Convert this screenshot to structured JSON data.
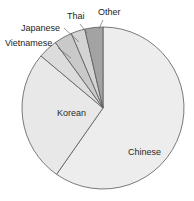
{
  "chart_data": {
    "type": "pie",
    "title": "",
    "subtitle": "",
    "xlabel": "",
    "ylabel": "",
    "legend_position": "none",
    "grid": false,
    "start_angle_deg": 90,
    "direction": "clockwise",
    "categories": [
      "Chinese",
      "Korean",
      "Vietnamese",
      "Japanese",
      "Thai",
      "Other"
    ],
    "values": [
      59.7,
      26.4,
      3.9,
      3.6,
      2.8,
      3.6
    ],
    "units": "percent",
    "slices": [
      {
        "label": "Chinese",
        "value": 59.7,
        "angle_deg": 215,
        "color": "#ededed",
        "label_placement": "inside",
        "label_x": 128,
        "label_y": 155
      },
      {
        "label": "Korean",
        "value": 26.4,
        "angle_deg": 95,
        "color": "#e8e8e8",
        "label_placement": "inside",
        "label_x": 57,
        "label_y": 116
      },
      {
        "label": "Vietnamese",
        "value": 3.9,
        "angle_deg": 14,
        "color": "#dcdcdc",
        "label_placement": "outside",
        "label_x": 5,
        "label_y": 46
      },
      {
        "label": "Japanese",
        "value": 3.6,
        "angle_deg": 13,
        "color": "#c9c9c9",
        "label_placement": "outside",
        "label_x": 21,
        "label_y": 31
      },
      {
        "label": "Thai",
        "value": 2.8,
        "angle_deg": 10,
        "color": "#d4d4d4",
        "label_placement": "outside",
        "label_x": 67,
        "label_y": 19
      },
      {
        "label": "Other",
        "value": 3.6,
        "angle_deg": 13,
        "color": "#a3a3a3",
        "label_placement": "outside",
        "label_x": 98,
        "label_y": 15
      }
    ],
    "geometry": {
      "center_x": 103,
      "center_y": 108,
      "radius": 81
    },
    "colors": {
      "outline": "#58595b",
      "leader_line": "#6f6f6f",
      "label_text": "#1c1c1c",
      "background": "#ffffff"
    }
  }
}
